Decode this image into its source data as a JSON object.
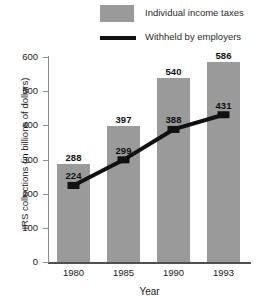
{
  "chart_data": {
    "type": "bar",
    "title": "",
    "xlabel": "Year",
    "ylabel": "IRS collections (in billions of dollars)",
    "categories": [
      "1980",
      "1985",
      "1990",
      "1993"
    ],
    "ylim": [
      0,
      600
    ],
    "yticks": [
      0,
      100,
      200,
      300,
      400,
      500,
      600
    ],
    "grid": false,
    "legend_position": "top",
    "series": [
      {
        "name": "Individual income taxes",
        "render": "bar",
        "color": "#9a9a9a",
        "values": [
          288,
          397,
          540,
          586
        ]
      },
      {
        "name": "Withheld by employers",
        "render": "line",
        "color": "#111111",
        "values": [
          224,
          299,
          388,
          431
        ]
      }
    ]
  },
  "legend": {
    "bars_label": "Individual income taxes",
    "line_label": "Withheld by employers"
  },
  "axes": {
    "y_title": "IRS collections (in billions of dollars)",
    "x_title": "Year",
    "y_ticks": [
      "600",
      "500",
      "400",
      "300",
      "200",
      "100",
      "0"
    ],
    "x_ticks": [
      "1980",
      "1985",
      "1990",
      "1993"
    ]
  },
  "bar_labels": [
    "288",
    "397",
    "540",
    "586"
  ],
  "line_labels": [
    "224",
    "299",
    "388",
    "431"
  ],
  "colors": {
    "bar_fill": "#9a9a9a",
    "line": "#111111",
    "axis": "#8e8e8e",
    "text": "#1a1a1a"
  }
}
